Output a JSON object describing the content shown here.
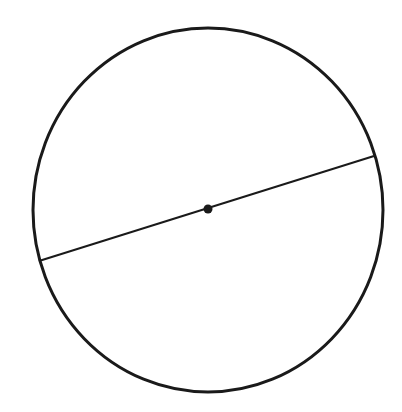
{
  "diagram": {
    "type": "circle-with-diameter",
    "background": "#ffffff",
    "stroke_color": "#1a1a1a",
    "circle": {
      "cx": 208,
      "cy": 210,
      "rx": 175,
      "ry": 182,
      "stroke_width": 3
    },
    "diameter": {
      "x1": 39,
      "y1": 261,
      "x2": 374,
      "y2": 156,
      "stroke_width": 2
    },
    "center_point": {
      "cx": 208,
      "cy": 209,
      "r": 4.5
    }
  }
}
